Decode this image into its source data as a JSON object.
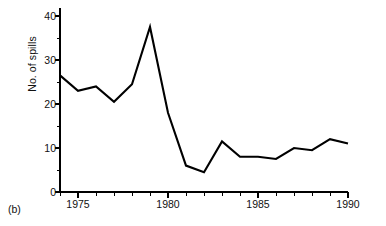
{
  "figure": {
    "panel_label": "(b)",
    "y_axis_title": "No. of spills"
  },
  "chart_data": {
    "type": "line",
    "title": "",
    "subtitle": "",
    "xlabel": "",
    "ylabel": "No. of spills",
    "x": [
      1974,
      1975,
      1976,
      1977,
      1978,
      1979,
      1980,
      1981,
      1982,
      1983,
      1984,
      1985,
      1986,
      1987,
      1988,
      1989,
      1990
    ],
    "values": [
      26.5,
      23.0,
      24.0,
      20.5,
      24.5,
      37.5,
      18.0,
      6.0,
      4.5,
      11.5,
      8.0,
      8.0,
      7.5,
      10.0,
      9.5,
      12.0,
      11.0
    ],
    "series": [
      {
        "name": "No. of spills",
        "values": [
          26.5,
          23.0,
          24.0,
          20.5,
          24.5,
          37.5,
          18.0,
          6.0,
          4.5,
          11.5,
          8.0,
          8.0,
          7.5,
          10.0,
          9.5,
          12.0,
          11.0
        ]
      }
    ],
    "xlim": [
      1974,
      1990
    ],
    "ylim": [
      0,
      40
    ],
    "x_major_ticks": [
      1975,
      1980,
      1985,
      1990
    ],
    "x_major_tick_labels": [
      "1975",
      "1980",
      "1985",
      "1990"
    ],
    "x_minor_ticks": [
      1974,
      1976,
      1977,
      1978,
      1979,
      1981,
      1982,
      1983,
      1984,
      1986,
      1987,
      1988,
      1989
    ],
    "y_major_ticks": [
      0,
      10,
      20,
      30,
      40
    ],
    "y_major_tick_labels": [
      "0",
      "10",
      "20",
      "30",
      "40"
    ],
    "y_minor_ticks": [
      5,
      15,
      25,
      35
    ],
    "grid": false,
    "legend": false,
    "line_color": "#000000",
    "axis_color": "#000000",
    "background_color": "#ffffff"
  },
  "y_ticks": [
    {
      "label": "40"
    },
    {
      "label": "30"
    },
    {
      "label": "20"
    },
    {
      "label": "10"
    },
    {
      "label": "0"
    }
  ],
  "x_ticks": [
    {
      "label": "1975"
    },
    {
      "label": "1980"
    },
    {
      "label": "1985"
    },
    {
      "label": "1990"
    }
  ]
}
